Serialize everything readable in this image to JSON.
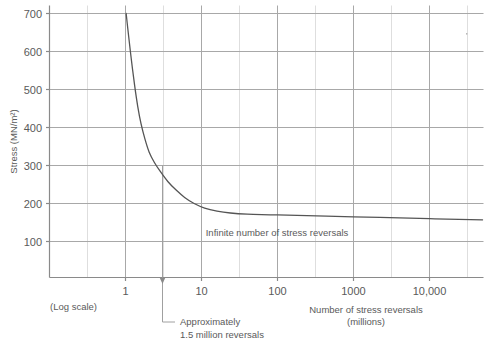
{
  "chart_data": {
    "type": "line",
    "title": "",
    "xlabel": "Number of stress reversals (millions)",
    "xlabel_line1": "Number of stress reversals",
    "xlabel_line2": "(millions)",
    "ylabel": "Stress (MN/m²)",
    "x_scale": "log",
    "x_scale_note": "(Log scale)",
    "xlim": [
      0.2,
      60000
    ],
    "ylim": [
      0,
      700
    ],
    "grid": true,
    "legend_position": "none",
    "xticks": [
      1,
      10,
      100,
      1000,
      10000
    ],
    "xtick_labels": [
      "1",
      "10",
      "100",
      "1000",
      "10,000"
    ],
    "yticks": [
      100,
      200,
      300,
      400,
      500,
      600,
      700
    ],
    "ytick_labels": [
      "100",
      "200",
      "300",
      "400",
      "500",
      "600",
      "700"
    ],
    "series": [
      {
        "name": "S-N fatigue curve",
        "color": "#555555",
        "points": [
          {
            "x": 1.02,
            "y": 700
          },
          {
            "x": 1.1,
            "y": 640
          },
          {
            "x": 1.2,
            "y": 575
          },
          {
            "x": 1.32,
            "y": 510
          },
          {
            "x": 1.45,
            "y": 455
          },
          {
            "x": 1.6,
            "y": 410
          },
          {
            "x": 1.8,
            "y": 370
          },
          {
            "x": 2.05,
            "y": 335
          },
          {
            "x": 2.4,
            "y": 308
          },
          {
            "x": 2.9,
            "y": 283
          },
          {
            "x": 3.6,
            "y": 258
          },
          {
            "x": 4.6,
            "y": 236
          },
          {
            "x": 6.0,
            "y": 216
          },
          {
            "x": 8.0,
            "y": 200
          },
          {
            "x": 11.0,
            "y": 188
          },
          {
            "x": 16.0,
            "y": 180
          },
          {
            "x": 24.0,
            "y": 175
          },
          {
            "x": 40.0,
            "y": 172
          },
          {
            "x": 100.0,
            "y": 170
          },
          {
            "x": 1000.0,
            "y": 165
          },
          {
            "x": 10000.0,
            "y": 160
          },
          {
            "x": 50000.0,
            "y": 157
          }
        ]
      }
    ],
    "annotations": [
      {
        "name": "endurance-limit-label",
        "text": "Infinite number of stress reversals",
        "x": 100,
        "y": 128
      },
      {
        "name": "marker-callout",
        "text_line1": "Approximately",
        "text_line2": "1.5 million reversals",
        "marker_x": 2.4,
        "marker_y_top": 300,
        "marker_y_bottom": 0
      }
    ]
  },
  "axes": {
    "y_title": "Stress (MN/m²)",
    "x_title_line1": "Number of stress reversals",
    "x_title_line2": "(millions)",
    "log_scale_note": "(Log scale)"
  },
  "colors": {
    "curve": "#555555",
    "major_grid": "#9b9b9b",
    "minor_grid": "#d8d8d8",
    "axis": "#8a8a8a",
    "text": "#5a5a5a",
    "marker": "#9b9b9b",
    "background": "#ffffff"
  }
}
